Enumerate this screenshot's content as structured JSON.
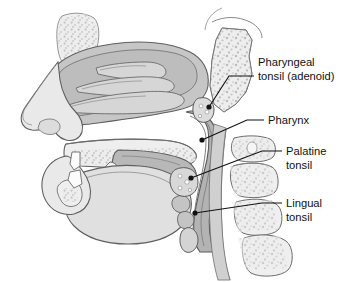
{
  "figure": {
    "background_color": "#ffffff",
    "line_color": "#3a3a3a",
    "label_text_color": "#101010",
    "palette": {
      "skin_light": "#e9e9e9",
      "bone_light": "#ededed",
      "bone_speckle": "#b9b9b9",
      "mucosa_gray": "#b5b5b5",
      "cavity_gray": "#c3c3c3",
      "tongue_light": "#e2e2e2",
      "soft_tissue": "#d2d2d2",
      "outline": "#555555"
    }
  },
  "labels": [
    {
      "id": "pharyngeal-tonsil",
      "line1": "Pharyngeal",
      "line2": "tonsil (adenoid)",
      "text_x": 258,
      "text_y": 66,
      "leader": {
        "x1": 254,
        "y1": 76,
        "x2": 229,
        "y2": 76,
        "x3": 209,
        "y3": 107
      },
      "dot": {
        "cx": 209,
        "cy": 107,
        "r": 2.6
      }
    },
    {
      "id": "pharynx",
      "line1": "Pharynx",
      "line2": "",
      "text_x": 268,
      "text_y": 124,
      "leader": {
        "x1": 264,
        "y1": 120,
        "x2": 247,
        "y2": 120,
        "x3": 202,
        "y3": 140
      },
      "dot": {
        "cx": 202,
        "cy": 140,
        "r": 2.6
      }
    },
    {
      "id": "palatine-tonsil",
      "line1": "Palatine",
      "line2": "tonsil",
      "text_x": 286,
      "text_y": 155,
      "leader": {
        "x1": 282,
        "y1": 151,
        "x2": 262,
        "y2": 151,
        "x3": 191,
        "y3": 178
      },
      "dot": {
        "cx": 191,
        "cy": 178,
        "r": 2.6
      }
    },
    {
      "id": "lingual-tonsil",
      "line1": "Lingual",
      "line2": "tonsil",
      "text_x": 286,
      "text_y": 207,
      "leader": {
        "x1": 282,
        "y1": 203,
        "x2": 262,
        "y2": 203,
        "x3": 195,
        "y3": 213
      },
      "dot": {
        "cx": 195,
        "cy": 213,
        "r": 2.6
      }
    }
  ],
  "anatomy_parts": [
    {
      "id": "nasal-cavity",
      "name": "nasal cavity"
    },
    {
      "id": "superior-concha",
      "name": "superior nasal concha"
    },
    {
      "id": "middle-concha",
      "name": "middle nasal concha"
    },
    {
      "id": "inferior-concha",
      "name": "inferior nasal concha"
    },
    {
      "id": "nose-external",
      "name": "external nose"
    },
    {
      "id": "sphenoid-bone",
      "name": "sphenoid / occipital bone"
    },
    {
      "id": "hard-palate",
      "name": "hard palate"
    },
    {
      "id": "soft-palate",
      "name": "soft palate and uvula"
    },
    {
      "id": "tongue",
      "name": "tongue"
    },
    {
      "id": "mandible",
      "name": "mandible"
    },
    {
      "id": "epiglottis",
      "name": "epiglottis"
    },
    {
      "id": "cervical-vertebrae",
      "name": "cervical vertebrae"
    },
    {
      "id": "pharyngeal-wall",
      "name": "posterior pharyngeal wall"
    }
  ]
}
